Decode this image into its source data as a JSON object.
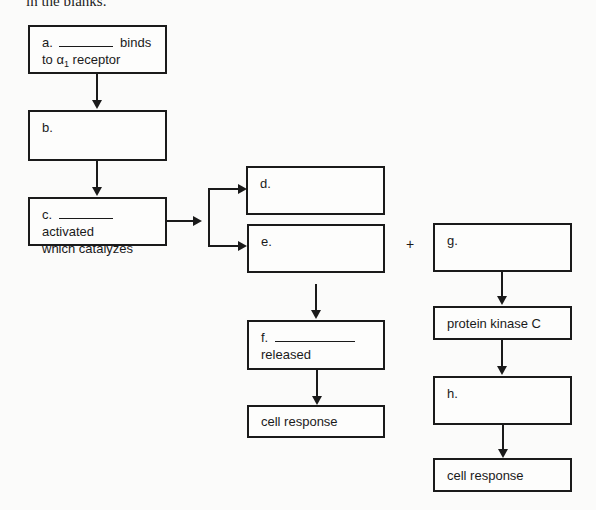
{
  "header": {
    "fragment": "in the blanks."
  },
  "boxes": {
    "a": {
      "label": "a.",
      "after_blank": "binds",
      "line2_prefix": "to ",
      "greek": "α",
      "subscript": "1",
      "line2_suffix": " receptor"
    },
    "b": {
      "label": "b."
    },
    "c": {
      "label": "c.",
      "after_blank": "activated",
      "line2": "which catalyzes"
    },
    "d": {
      "label": "d."
    },
    "e": {
      "label": "e."
    },
    "f": {
      "label": "f.",
      "line2": "released"
    },
    "f_response": {
      "label": "cell response"
    },
    "g": {
      "label": "g."
    },
    "pkc": {
      "label": "protein kinase C"
    },
    "h": {
      "label": "h."
    },
    "h_response": {
      "label": "cell response"
    }
  },
  "operators": {
    "plus": "+"
  },
  "colors": {
    "line": "#1a1a1a",
    "background": "#fbfbfa"
  }
}
